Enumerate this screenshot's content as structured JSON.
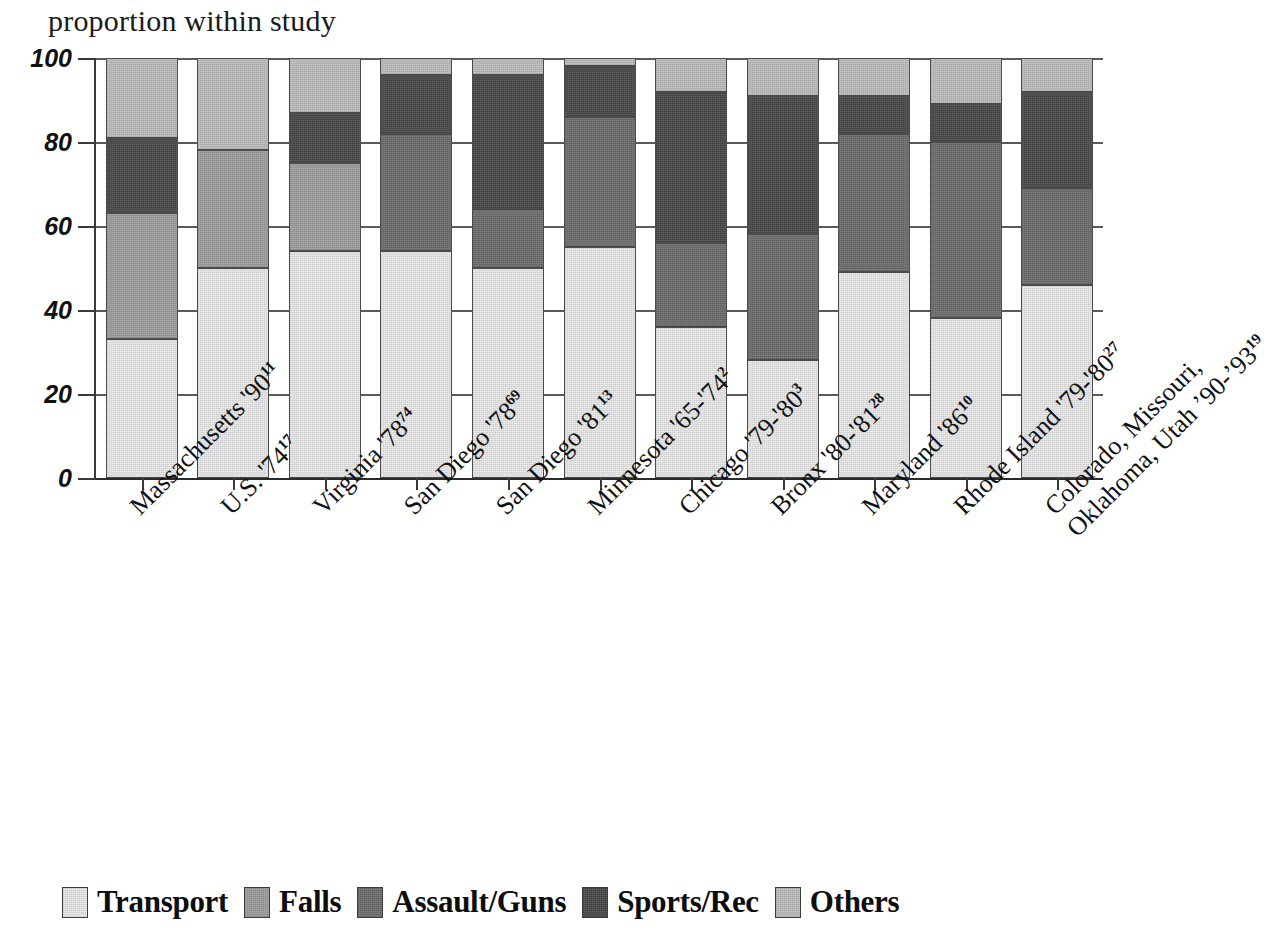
{
  "chart_data": {
    "type": "bar",
    "subtype": "stacked-100-percent",
    "title": "proportion within study",
    "xlabel": "",
    "ylabel": "",
    "ylim": [
      0,
      100
    ],
    "yticks": [
      0,
      20,
      40,
      60,
      80,
      100
    ],
    "ytick_labels": [
      "0",
      "20",
      "40",
      "60",
      "80",
      "100"
    ],
    "grid": true,
    "legend_position": "bottom",
    "categories": [
      "Massachusetts '90",
      "U.S. '74",
      "Virginia '78",
      "San Diego '78",
      "San Diego '81",
      "Minnesota '65-'74",
      "Chicago '79-'80",
      "Bronx '80-'81",
      "Maryland '86",
      "Rhode Island '79-'80",
      "Colorado, Missouri, Oklahoma, Utah '90-'93"
    ],
    "category_refs": [
      "11",
      "17",
      "74",
      "69",
      "13",
      "2",
      "3",
      "28",
      "10",
      "27",
      "19"
    ],
    "series": [
      {
        "name": "Transport",
        "color": "#e8e8e8",
        "values": [
          33,
          50,
          54,
          54,
          50,
          55,
          36,
          28,
          49,
          38,
          46
        ]
      },
      {
        "name": "Falls",
        "color": "#9e9e9e",
        "values": [
          30,
          28,
          21,
          0,
          0,
          0,
          0,
          0,
          0,
          0,
          0
        ]
      },
      {
        "name": "Assault/Guns",
        "color": "#6e6e6e",
        "values": [
          0,
          0,
          0,
          28,
          14,
          31,
          20,
          30,
          33,
          42,
          23
        ]
      },
      {
        "name": "Sports/Rec",
        "color": "#4a4a4a",
        "values": [
          18,
          0,
          12,
          14,
          32,
          12,
          36,
          33,
          9,
          9,
          23
        ]
      },
      {
        "name": "Others",
        "color": "#bdbdbd",
        "values": [
          19,
          22,
          13,
          4,
          4,
          2,
          8,
          9,
          9,
          11,
          8
        ]
      }
    ],
    "legend": [
      {
        "label": "Transport",
        "color": "#e8e8e8"
      },
      {
        "label": "Falls",
        "color": "#9e9e9e"
      },
      {
        "label": "Assault/Guns",
        "color": "#6e6e6e"
      },
      {
        "label": "Sports/Rec",
        "color": "#4a4a4a"
      },
      {
        "label": "Others",
        "color": "#bdbdbd"
      }
    ]
  }
}
